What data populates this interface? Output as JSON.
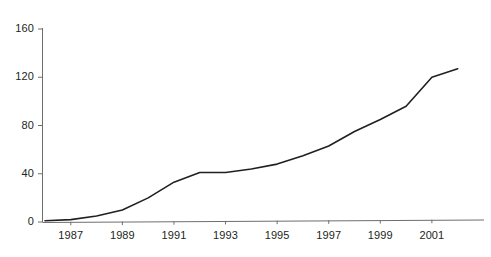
{
  "chart_data": {
    "type": "line",
    "title": "",
    "subtitle": "",
    "xlabel": "",
    "ylabel": "",
    "x": [
      1986,
      1987,
      1988,
      1989,
      1990,
      1991,
      1992,
      1993,
      1994,
      1995,
      1996,
      1997,
      1998,
      1999,
      2000,
      2001,
      2002
    ],
    "values": [
      1,
      2,
      5,
      10,
      20,
      33,
      41,
      41,
      44,
      48,
      55,
      63,
      75,
      85,
      96,
      120,
      127
    ],
    "series": [
      {
        "name": "",
        "values": [
          1,
          2,
          5,
          10,
          20,
          33,
          41,
          41,
          44,
          48,
          55,
          63,
          75,
          85,
          96,
          120,
          127
        ]
      }
    ],
    "xlim": [
      1986,
      2002.4
    ],
    "ylim": [
      0,
      160
    ],
    "y_ticks": [
      0,
      40,
      80,
      120,
      160
    ],
    "y_tick_labels": [
      "0",
      "40",
      "80",
      "120",
      "160"
    ],
    "x_ticks": [
      1987,
      1989,
      1991,
      1993,
      1995,
      1997,
      1999,
      2001
    ],
    "x_tick_labels": [
      "1987",
      "1989",
      "1991",
      "1993",
      "1995",
      "1997",
      "1999",
      "2001"
    ],
    "grid": false,
    "legend": false,
    "legend_position": "none",
    "line_color": "#231f20",
    "axis_color": "#6d6e71",
    "background_color": "#ffffff",
    "annotations": []
  }
}
